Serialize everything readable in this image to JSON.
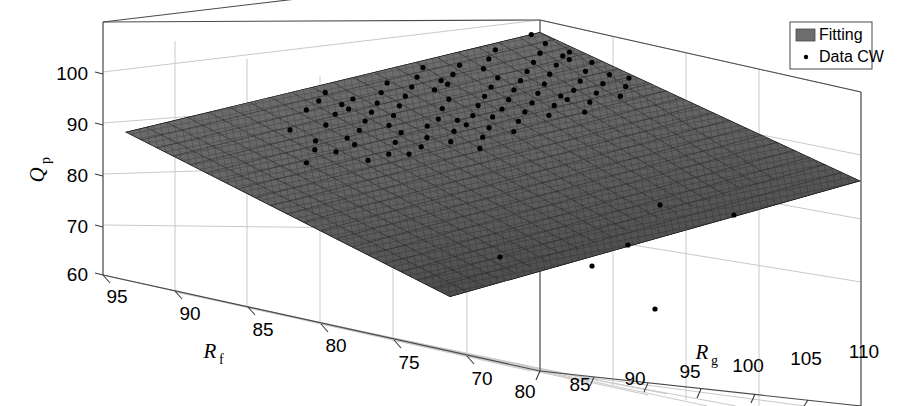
{
  "chart_data": {
    "type": "scatter",
    "title": "",
    "subtitle": "",
    "projection": "3d-surface-with-scatter",
    "xlabel": "R_g",
    "ylabel": "R_f",
    "zlabel": "Q_p",
    "grid": true,
    "legend_position": "top-right",
    "axes": {
      "x": {
        "label": "R",
        "label_sub": "g",
        "ticks": [
          80,
          85,
          90,
          95,
          100,
          105,
          110
        ],
        "tick_labels": [
          "80",
          "85",
          "90",
          "95",
          "100",
          "105",
          "110"
        ],
        "range": [
          78,
          112
        ]
      },
      "y": {
        "label": "R",
        "label_sub": "f",
        "ticks": [
          95,
          90,
          85,
          80,
          75,
          70
        ],
        "tick_labels": [
          "95",
          "90",
          "85",
          "80",
          "75",
          "70"
        ],
        "range": [
          68,
          97
        ]
      },
      "z": {
        "label": "Q",
        "label_sub": "p",
        "ticks": [
          60,
          70,
          80,
          90,
          100
        ],
        "tick_labels": [
          "60",
          "70",
          "80",
          "90",
          "100"
        ],
        "range": [
          55,
          105
        ]
      }
    },
    "legend": [
      {
        "label": "Fitting",
        "marker": "patch",
        "color": "#6e6e6e"
      },
      {
        "label": "Data CW",
        "marker": "dot",
        "color": "#000000"
      }
    ],
    "series": [
      {
        "name": "Fitting",
        "type": "surface",
        "description": "planar fitted mesh surface, dark gray",
        "mesh_color": "#555555",
        "face_color": "#6a6a6a",
        "corners_z": {
          "low_front": 62,
          "high_back": 99,
          "left": 90,
          "right": 80
        }
      },
      {
        "name": "Data CW",
        "type": "scatter3d",
        "marker": "point",
        "color": "#000000",
        "count": 96,
        "points": [
          [
            -0.332,
            -0.055
          ],
          [
            -0.268,
            -0.102
          ],
          [
            -0.243,
            -0.07
          ],
          [
            -0.236,
            -0.128
          ],
          [
            -0.218,
            -0.041
          ],
          [
            -0.206,
            -0.162
          ],
          [
            -0.186,
            -0.09
          ],
          [
            -0.171,
            -0.133
          ],
          [
            -0.16,
            -0.058
          ],
          [
            -0.152,
            -0.184
          ],
          [
            -0.14,
            -0.112
          ],
          [
            -0.13,
            -0.038
          ],
          [
            -0.122,
            -0.15
          ],
          [
            -0.112,
            -0.079
          ],
          [
            -0.103,
            -0.196
          ],
          [
            -0.096,
            -0.121
          ],
          [
            -0.088,
            -0.046
          ],
          [
            -0.08,
            -0.167
          ],
          [
            -0.072,
            -0.096
          ],
          [
            -0.066,
            -0.21
          ],
          [
            -0.058,
            -0.137
          ],
          [
            -0.05,
            -0.062
          ],
          [
            -0.044,
            -0.18
          ],
          [
            -0.036,
            -0.106
          ],
          [
            -0.028,
            -0.031
          ],
          [
            -0.02,
            -0.152
          ],
          [
            -0.013,
            -0.086
          ],
          [
            -0.005,
            -0.199
          ],
          [
            0.002,
            -0.124
          ],
          [
            0.01,
            -0.051
          ],
          [
            0.018,
            -0.168
          ],
          [
            0.026,
            -0.094
          ],
          [
            0.034,
            -0.018
          ],
          [
            0.042,
            -0.141
          ],
          [
            0.05,
            -0.072
          ],
          [
            0.058,
            -0.188
          ],
          [
            0.066,
            -0.114
          ],
          [
            0.074,
            -0.04
          ],
          [
            0.082,
            -0.158
          ],
          [
            0.09,
            -0.084
          ],
          [
            0.098,
            -0.205
          ],
          [
            0.106,
            -0.13
          ],
          [
            0.114,
            -0.056
          ],
          [
            0.122,
            -0.174
          ],
          [
            0.13,
            -0.1
          ],
          [
            0.138,
            -0.025
          ],
          [
            0.146,
            -0.146
          ],
          [
            0.154,
            -0.077
          ],
          [
            0.162,
            -0.192
          ],
          [
            0.17,
            -0.118
          ],
          [
            0.178,
            -0.044
          ],
          [
            0.186,
            -0.162
          ],
          [
            0.194,
            -0.088
          ],
          [
            0.202,
            -0.209
          ],
          [
            0.21,
            -0.134
          ],
          [
            0.218,
            -0.06
          ],
          [
            0.226,
            -0.178
          ],
          [
            0.234,
            -0.104
          ],
          [
            0.242,
            -0.03
          ],
          [
            0.25,
            -0.15
          ],
          [
            0.258,
            -0.075
          ],
          [
            0.266,
            -0.196
          ],
          [
            0.274,
            -0.122
          ],
          [
            0.282,
            -0.048
          ],
          [
            0.29,
            -0.166
          ],
          [
            0.298,
            -0.092
          ],
          [
            0.306,
            -0.212
          ],
          [
            0.314,
            -0.138
          ],
          [
            0.322,
            -0.064
          ],
          [
            0.33,
            -0.182
          ],
          [
            0.338,
            -0.108
          ],
          [
            0.346,
            -0.034
          ],
          [
            0.354,
            -0.154
          ],
          [
            0.362,
            -0.08
          ],
          [
            0.37,
            -0.2
          ],
          [
            0.378,
            -0.126
          ],
          [
            0.386,
            -0.052
          ],
          [
            0.394,
            -0.17
          ],
          [
            0.402,
            -0.096
          ],
          [
            0.41,
            -0.216
          ],
          [
            0.418,
            -0.142
          ],
          [
            0.426,
            -0.068
          ],
          [
            0.434,
            -0.186
          ],
          [
            0.442,
            -0.112
          ],
          [
            0.45,
            -0.038
          ],
          [
            0.458,
            -0.158
          ],
          [
            0.466,
            -0.084
          ],
          [
            0.474,
            -0.204
          ],
          [
            0.482,
            -0.13
          ],
          [
            0.49,
            -0.056
          ],
          [
            0.498,
            -0.174
          ],
          [
            0.506,
            -0.1
          ],
          [
            0.514,
            -0.22
          ],
          [
            0.522,
            -0.146
          ],
          [
            0.53,
            -0.072
          ],
          [
            0.538,
            -0.19
          ]
        ]
      }
    ]
  },
  "legend": {
    "fitting_label": "Fitting",
    "data_label": "Data CW"
  },
  "axis_labels": {
    "z_main": "Q",
    "z_sub": "p",
    "y_main": "R",
    "y_sub": "f",
    "x_main": "R",
    "x_sub": "g"
  },
  "z_ticks": [
    "100",
    "90",
    "80",
    "70",
    "60"
  ],
  "y_ticks": [
    "95",
    "90",
    "85",
    "80",
    "75",
    "70"
  ],
  "x_ticks": [
    "80",
    "85",
    "90",
    "95",
    "100",
    "105",
    "110"
  ]
}
